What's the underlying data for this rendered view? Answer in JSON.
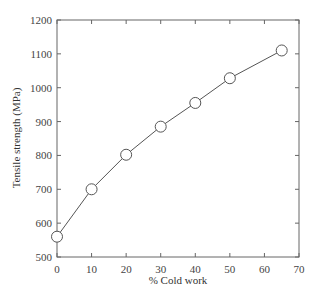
{
  "chart_data": {
    "type": "line",
    "title": "",
    "xlabel": "% Cold work",
    "ylabel": "Tensile strength (MPa)",
    "xlim": [
      0,
      70
    ],
    "ylim": [
      500,
      1200
    ],
    "xticks": [
      0,
      10,
      20,
      30,
      40,
      50,
      60,
      70
    ],
    "yticks": [
      500,
      600,
      700,
      800,
      900,
      1000,
      1100,
      1200
    ],
    "grid": false,
    "legend": null,
    "marker": "open-circle",
    "series": [
      {
        "name": "Tensile strength",
        "x": [
          0,
          10,
          20,
          30,
          40,
          50,
          65
        ],
        "y": [
          560,
          700,
          802,
          885,
          955,
          1028,
          1110
        ]
      }
    ]
  }
}
